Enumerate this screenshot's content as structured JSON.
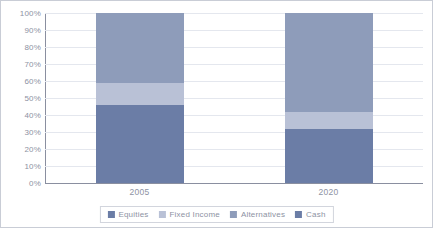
{
  "chart_data": {
    "type": "bar",
    "stacked": true,
    "normalized": "100%",
    "title": "",
    "xlabel": "",
    "ylabel": "",
    "categories": [
      "2005",
      "2020"
    ],
    "ylim": [
      0,
      100
    ],
    "ytick_labels": [
      "0%",
      "10%",
      "20%",
      "30%",
      "40%",
      "50%",
      "60%",
      "70%",
      "80%",
      "90%",
      "100%"
    ],
    "ytick_values": [
      0,
      10,
      20,
      30,
      40,
      50,
      60,
      70,
      80,
      90,
      100
    ],
    "grid": true,
    "legend_position": "bottom",
    "series": [
      {
        "name": "Equities",
        "color": "#6b7da6",
        "values": [
          46,
          32
        ]
      },
      {
        "name": "Fixed Income",
        "color": "#b9c1d6",
        "values": [
          13,
          10
        ]
      },
      {
        "name": "Alternatives",
        "color": "#8e9cba",
        "values": [
          41,
          58
        ]
      },
      {
        "name": "Cash",
        "color": "#6b7da6",
        "values": [
          0,
          0
        ]
      }
    ]
  }
}
